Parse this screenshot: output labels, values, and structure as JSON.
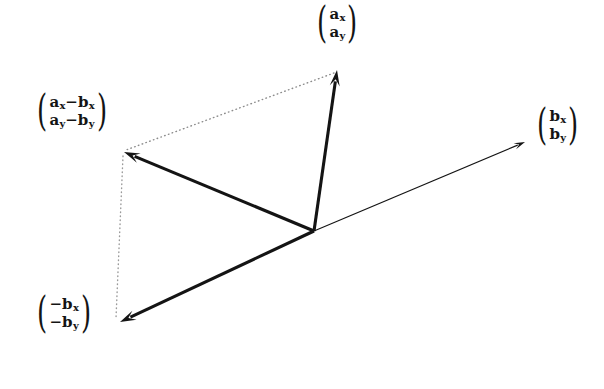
{
  "figure": {
    "kind": "vector-subtraction-diagram",
    "background_color": "#ffffff",
    "ink_color": "#141414",
    "width": 604,
    "height": 389
  },
  "labels": {
    "a": {
      "name": "vector-a-label",
      "row1": "a",
      "row1_sub": "x",
      "row2": "a",
      "row2_sub": "y"
    },
    "b": {
      "name": "vector-b-label",
      "row1": "b",
      "row1_sub": "x",
      "row2": "b",
      "row2_sub": "y"
    },
    "a_minus_b": {
      "name": "vector-a-minus-b-label",
      "row1_first": "a",
      "row1_first_sub": "x",
      "row1_op": "−",
      "row1_second": "b",
      "row1_second_sub": "x",
      "row2_first": "a",
      "row2_first_sub": "y",
      "row2_op": "−",
      "row2_second": "b",
      "row2_second_sub": "y"
    },
    "neg_b": {
      "name": "vector-negative-b-label",
      "row1_op": "−",
      "row1": "b",
      "row1_sub": "x",
      "row2_op": "−",
      "row2": "b",
      "row2_sub": "y"
    },
    "paren_open": "(",
    "paren_close": ")"
  },
  "chart_data": {
    "type": "scatter",
    "title": "",
    "xlabel": "",
    "ylabel": "",
    "grid": false,
    "legend": "none",
    "origin": {
      "x": 314,
      "y": 231
    },
    "vectors": [
      {
        "name": "a",
        "label": "(a_x, a_y)",
        "from": {
          "x": 314,
          "y": 231
        },
        "to": {
          "x": 337,
          "y": 70
        },
        "style": "solid",
        "stroke_width": 3.1,
        "arrowhead": "end",
        "color": "#141414"
      },
      {
        "name": "b",
        "label": "(b_x, b_y)",
        "from": {
          "x": 314,
          "y": 231
        },
        "to": {
          "x": 525,
          "y": 142
        },
        "style": "solid",
        "stroke_width": 1.2,
        "arrowhead": "end",
        "color": "#141414"
      },
      {
        "name": "a-minus-b",
        "label": "(a_x-b_x, a_y-b_y)",
        "from": {
          "x": 314,
          "y": 231
        },
        "to": {
          "x": 124,
          "y": 152
        },
        "style": "solid",
        "stroke_width": 3.1,
        "arrowhead": "end",
        "color": "#141414"
      },
      {
        "name": "negative-b",
        "label": "(-b_x, -b_y)",
        "from": {
          "x": 314,
          "y": 231
        },
        "to": {
          "x": 120,
          "y": 322
        },
        "style": "solid",
        "stroke_width": 3.1,
        "arrowhead": "end",
        "color": "#141414"
      }
    ],
    "construction_lines": [
      {
        "name": "dotted-a-tip-to-a-minus-b-tip",
        "from": {
          "x": 334,
          "y": 73
        },
        "to": {
          "x": 126,
          "y": 150
        },
        "style": "dotted",
        "stroke_width": 1.4,
        "color": "#8c8c8c"
      },
      {
        "name": "dotted-a-minus-b-tip-to-negative-b-tip",
        "from": {
          "x": 123,
          "y": 156
        },
        "to": {
          "x": 116,
          "y": 318
        },
        "style": "dotted",
        "stroke_width": 1.4,
        "color": "#9a9a9a"
      }
    ]
  }
}
